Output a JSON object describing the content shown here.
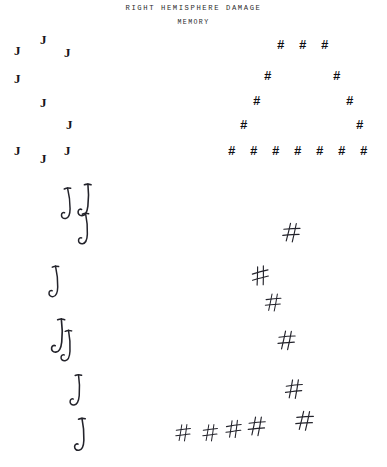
{
  "figure": {
    "title": "RIGHT HEMISPHERE DAMAGE",
    "subtitle": "MEMORY",
    "background_color": "#ffffff",
    "ink_color": "#23232b",
    "print_color": "#16161a"
  },
  "panels": {
    "stimulus_left": {
      "name": "global-J-made-of-local-J",
      "global_letter": "J",
      "local_letter": "J",
      "element_count": 8
    },
    "stimulus_right": {
      "name": "global-A-made-of-local-hash",
      "global_letter": "A",
      "local_letter": "#",
      "element_count": 16
    },
    "response_left": {
      "name": "patient-copy-of-J",
      "local_letter": "J",
      "element_count": 8,
      "note": "local elements preserved, global form lost"
    },
    "response_right": {
      "name": "patient-copy-of-A",
      "local_letter": "#",
      "element_count": 10,
      "note": "local elements preserved, global form lost"
    }
  },
  "stimulus_left_elements": [
    {
      "char": "J",
      "x": 40,
      "y": 33
    },
    {
      "char": "J",
      "x": 14,
      "y": 44
    },
    {
      "char": "J",
      "x": 64,
      "y": 46
    },
    {
      "char": "J",
      "x": 14,
      "y": 72
    },
    {
      "char": "J",
      "x": 40,
      "y": 96
    },
    {
      "char": "J",
      "x": 66,
      "y": 118
    },
    {
      "char": "J",
      "x": 14,
      "y": 144
    },
    {
      "char": "J",
      "x": 64,
      "y": 144
    },
    {
      "char": "J",
      "x": 40,
      "y": 152
    }
  ],
  "stimulus_right_elements": [
    {
      "char": "#",
      "x": 277,
      "y": 40
    },
    {
      "char": "#",
      "x": 299,
      "y": 40
    },
    {
      "char": "#",
      "x": 321,
      "y": 40
    },
    {
      "char": "#",
      "x": 264,
      "y": 71
    },
    {
      "char": "#",
      "x": 333,
      "y": 71
    },
    {
      "char": "#",
      "x": 253,
      "y": 96
    },
    {
      "char": "#",
      "x": 346,
      "y": 96
    },
    {
      "char": "#",
      "x": 240,
      "y": 120
    },
    {
      "char": "#",
      "x": 356,
      "y": 120
    },
    {
      "char": "#",
      "x": 228,
      "y": 146
    },
    {
      "char": "#",
      "x": 250,
      "y": 146
    },
    {
      "char": "#",
      "x": 272,
      "y": 146
    },
    {
      "char": "#",
      "x": 294,
      "y": 146
    },
    {
      "char": "#",
      "x": 316,
      "y": 146
    },
    {
      "char": "#",
      "x": 338,
      "y": 146
    },
    {
      "char": "#",
      "x": 360,
      "y": 146
    }
  ],
  "response_left_elements": [
    {
      "char": "J",
      "x": 59,
      "y": 188,
      "scale": 1.0,
      "rot": -4
    },
    {
      "char": "J",
      "x": 79,
      "y": 183,
      "scale": 1.05,
      "rot": 3
    },
    {
      "char": "J",
      "x": 77,
      "y": 213,
      "scale": 1.0,
      "rot": -2
    },
    {
      "char": "J",
      "x": 47,
      "y": 266,
      "scale": 1.0,
      "rot": -3
    },
    {
      "char": "J",
      "x": 52,
      "y": 318,
      "scale": 1.1,
      "rot": 2
    },
    {
      "char": "J",
      "x": 60,
      "y": 330,
      "scale": 1.0,
      "rot": -1
    },
    {
      "char": "J",
      "x": 70,
      "y": 374,
      "scale": 1.0,
      "rot": 1
    },
    {
      "char": "J",
      "x": 73,
      "y": 418,
      "scale": 1.05,
      "rot": -2
    }
  ],
  "response_right_elements": [
    {
      "char": "#",
      "x": 284,
      "y": 222,
      "scale": 1.0,
      "rot": 6
    },
    {
      "char": "#",
      "x": 251,
      "y": 267,
      "scale": 1.0,
      "rot": -6
    },
    {
      "char": "#",
      "x": 266,
      "y": 293,
      "scale": 0.92,
      "rot": 4
    },
    {
      "char": "#",
      "x": 279,
      "y": 330,
      "scale": 1.0,
      "rot": 5
    },
    {
      "char": "#",
      "x": 286,
      "y": 379,
      "scale": 1.0,
      "rot": 3
    },
    {
      "char": "#",
      "x": 176,
      "y": 424,
      "scale": 0.88,
      "rot": 2
    },
    {
      "char": "#",
      "x": 203,
      "y": 424,
      "scale": 0.88,
      "rot": 2
    },
    {
      "char": "#",
      "x": 226,
      "y": 420,
      "scale": 0.92,
      "rot": 1
    },
    {
      "char": "#",
      "x": 249,
      "y": 416,
      "scale": 1.0,
      "rot": 4
    },
    {
      "char": "#",
      "x": 297,
      "y": 410,
      "scale": 1.02,
      "rot": 6
    }
  ]
}
